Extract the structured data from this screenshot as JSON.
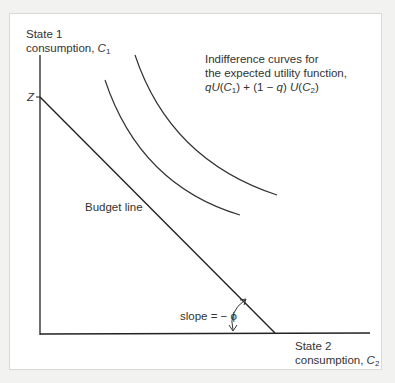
{
  "diagram": {
    "y_axis_label_line1": "State 1",
    "y_axis_label_line2": "consumption, ",
    "y_axis_var": "C",
    "y_axis_sub": "1",
    "x_axis_label_line1": "State 2",
    "x_axis_label_line2": "consumption, ",
    "x_axis_var": "C",
    "x_axis_sub": "2",
    "intercept_label": "Z",
    "budget_label": "Budget line",
    "slope_label": "slope = − ϕ",
    "curves_label_line1": "Indifference curves for",
    "curves_label_line2": "the expected utility function,",
    "formula": {
      "p1": "qU",
      "p2": "(",
      "v1": "C",
      "s1": "1",
      "p3": ") + (1 − ",
      "q": "q",
      "p4": ") ",
      "u2": "U",
      "p5": "(",
      "v2": "C",
      "s2": "2",
      "p6": ")"
    },
    "colors": {
      "line": "#222222",
      "text": "#333333",
      "background": "#f2f2f0",
      "panel": "#ffffff"
    }
  }
}
